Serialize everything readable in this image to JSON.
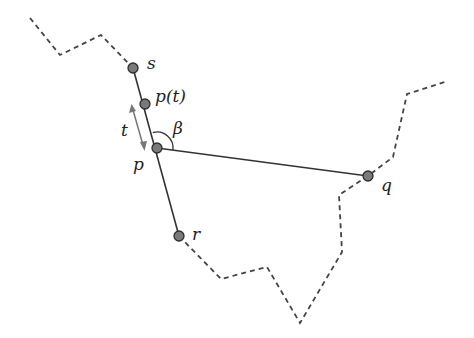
{
  "diagram": {
    "colors": {
      "line": "#333333",
      "dashed": "#444444",
      "point_fill": "#7a7a7a",
      "point_stroke": "#2e2e2e",
      "arrow": "#777777"
    },
    "points": {
      "s": {
        "x": 133,
        "y": 68,
        "label": "s",
        "lx": 147,
        "ly": 69
      },
      "pt": {
        "x": 145,
        "y": 104,
        "label": "p(t)",
        "lx": 156,
        "ly": 101
      },
      "p": {
        "x": 157,
        "y": 148,
        "label": "p",
        "lx": 135,
        "ly": 170
      },
      "q": {
        "x": 368,
        "y": 176,
        "label": "q",
        "lx": 382,
        "ly": 190
      },
      "r": {
        "x": 179,
        "y": 236,
        "label": "r",
        "lx": 193,
        "ly": 238
      }
    },
    "labels": {
      "t": "t",
      "beta": "β"
    },
    "dashed_upper": "30,18 60,55 101,35 133,68",
    "dashed_lower": "179,236 221,279 267,267 300,323 342,252 339,195 368,176 393,157 407,94 445,82"
  }
}
